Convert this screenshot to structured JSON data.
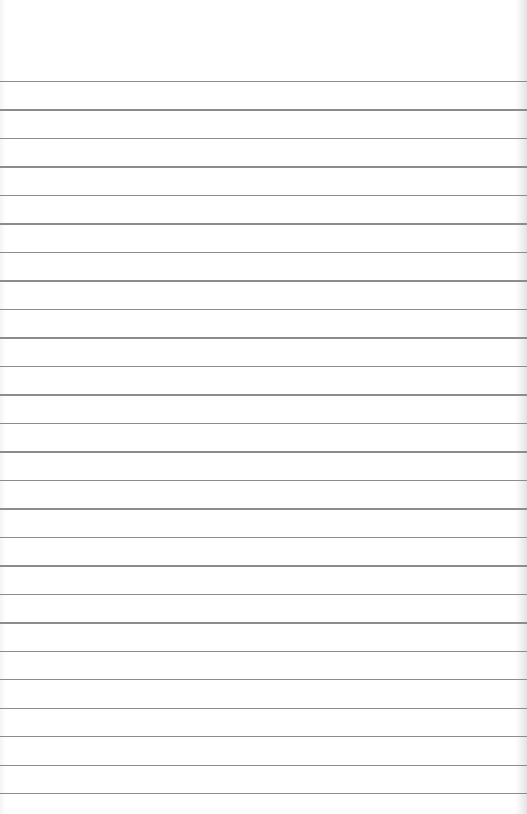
{
  "paper": {
    "type": "ruled-lined-paper",
    "background_color": "#ffffff",
    "line_color": "#8c8c8c",
    "line_count": 26,
    "first_line_y": 81,
    "line_spacing_px": 28.48
  }
}
